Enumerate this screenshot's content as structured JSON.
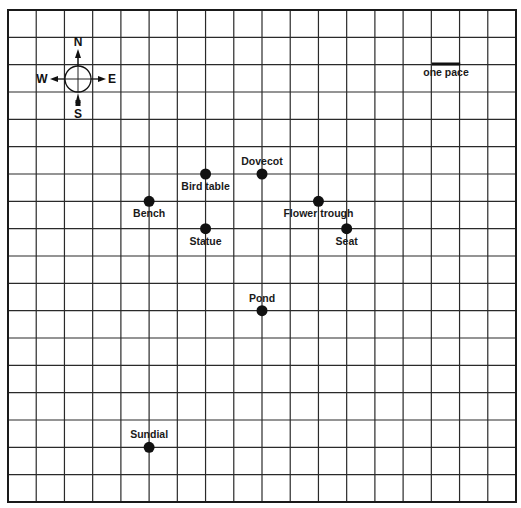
{
  "map": {
    "grid": {
      "left": 8,
      "top": 10,
      "right": 516,
      "bottom": 502,
      "cols": 18,
      "rows": 18,
      "line_color": "#2a2a2a",
      "border_color": "#1a1a1a"
    },
    "compass": {
      "center": [
        78,
        79
      ],
      "labels": {
        "north": "N",
        "south": "S",
        "east": "E",
        "west": "W"
      }
    },
    "scale": {
      "label": "one pace",
      "length_cells": 1
    },
    "landmarks": [
      {
        "name": "Dovecot",
        "col": 9,
        "row": 6,
        "label_pos": "above"
      },
      {
        "name": "Bird table",
        "col": 7,
        "row": 6,
        "label_pos": "below"
      },
      {
        "name": "Bench",
        "col": 5,
        "row": 7,
        "label_pos": "below"
      },
      {
        "name": "Flower trough",
        "col": 11,
        "row": 7,
        "label_pos": "below"
      },
      {
        "name": "Statue",
        "col": 7,
        "row": 8,
        "label_pos": "below"
      },
      {
        "name": "Seat",
        "col": 12,
        "row": 8,
        "label_pos": "below"
      },
      {
        "name": "Pond",
        "col": 9,
        "row": 11,
        "label_pos": "above"
      },
      {
        "name": "Sundial",
        "col": 5,
        "row": 16,
        "label_pos": "above"
      }
    ],
    "dot_color": "#111111"
  }
}
